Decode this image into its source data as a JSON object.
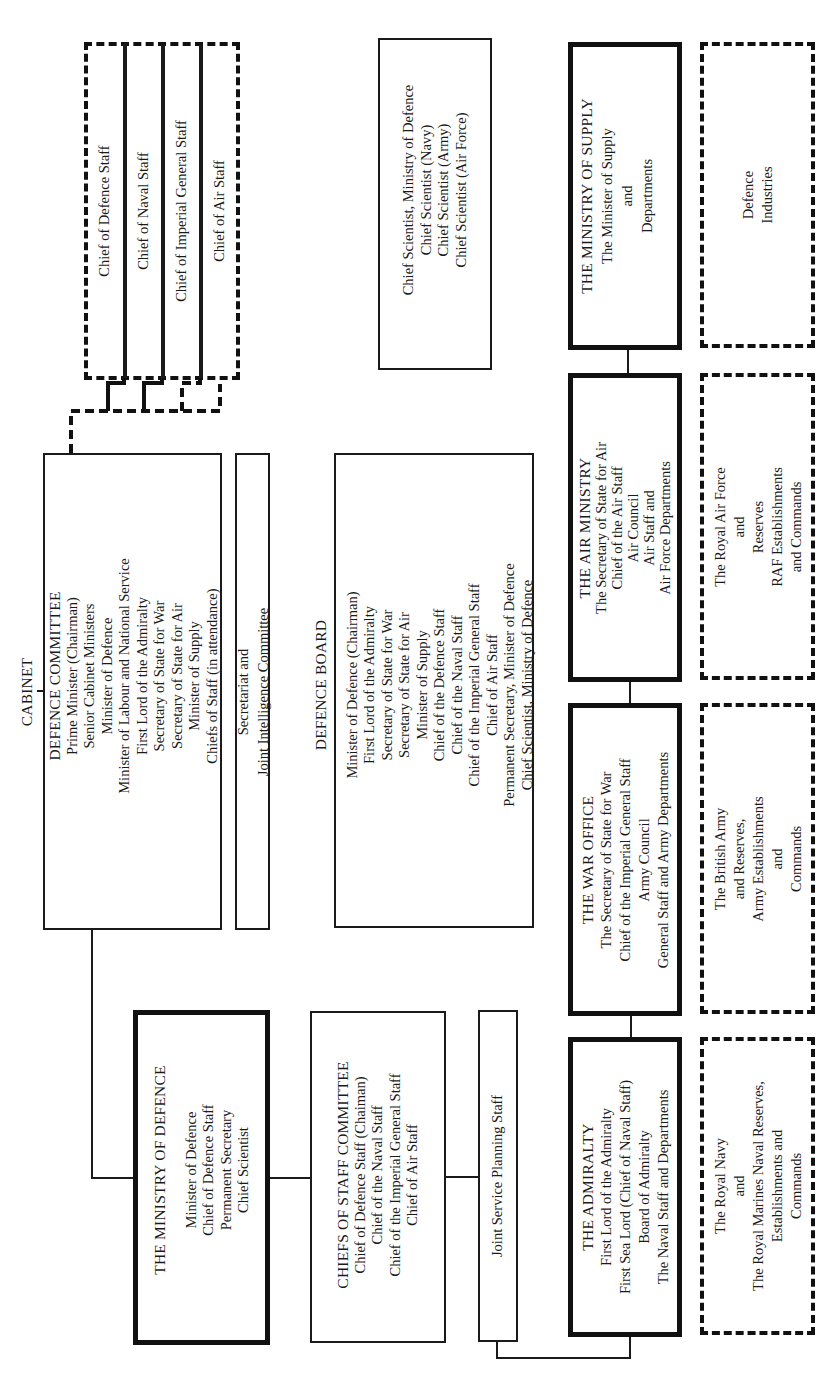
{
  "diagram": {
    "orientation": "rotated-90-ccw",
    "chiefs_group": {
      "style": "dashed",
      "items": [
        "Chief of Defence Staff",
        "Chief of Naval Staff",
        "Chief of Imperial General Staff",
        "Chief of Air Staff"
      ]
    },
    "cabinet": {
      "title": "CABINET",
      "defence_committee": {
        "title": "DEFENCE COMMITTEE",
        "members": [
          "Prime Minister (Chairman)",
          "Senior Cabinet Ministers",
          "Minister of Defence",
          "Minister of Labour and National Service",
          "First Lord of the Admiralty",
          "Secretary of State for War",
          "Secretary of State for Air",
          "Minister of Supply",
          "Chiefs of Staff (in attendance)"
        ]
      }
    },
    "secretariat": {
      "lines": [
        "Secretariat and",
        "Joint Intelligence Committee"
      ]
    },
    "chief_scientists": {
      "lines": [
        "Chief Scientist, Ministry of Defence",
        "Chief Scientist (Navy)",
        "Chief Scientist (Army)",
        "Chief Scientist (Air Force)"
      ]
    },
    "defence_board": {
      "title": "DEFENCE BOARD",
      "members": [
        "Minister of Defence (Chairman)",
        "First Lord of the Admiralty",
        "Secretary of State for War",
        "Secretary of State for Air",
        "Minister of Supply",
        "Chief of the Defence Staff",
        "Chief of the Naval Staff",
        "Chief of the Imperial General Staff",
        "Chief of Air Staff",
        "Permanent Secretary, Minister of Defence",
        "Chief Scientist, Ministry of Defence"
      ]
    },
    "ministry_of_defence": {
      "title": "THE MINISTRY OF DEFENCE",
      "members": [
        "Minister of Defence",
        "Chief of Defence Staff",
        "Permanent Secretary",
        "Chief Scientist"
      ]
    },
    "chiefs_of_staff_committee": {
      "title": "CHIEFS OF STAFF COMMITTEE",
      "members": [
        "Chief of Defence Staff (Chaiman)",
        "Chief of the Naval Staff",
        "Chief of the Imperial General Staff",
        "Chief of Air Staff"
      ]
    },
    "joint_service_planning": {
      "label": "Joint Service Planning Staff"
    },
    "ministry_of_supply": {
      "title": "THE MINISTRY OF SUPPLY",
      "lines": [
        "The Minister of Supply",
        "and",
        "Departments"
      ]
    },
    "air_ministry": {
      "title": "THE AIR MINISTRY",
      "lines": [
        "The Secretary of State for Air",
        "Chief of the Air Staff",
        "Air Council",
        "Air Staff and",
        "Air Force Departments"
      ]
    },
    "war_office": {
      "title": "THE WAR OFFICE",
      "lines": [
        "The Secretary of State for War",
        "Chief of the Imperial General Staff",
        "Army Council",
        "General Staff and Army Departments"
      ]
    },
    "admiralty": {
      "title": "THE ADMIRALTY",
      "lines": [
        "First Lord of the Admiralty",
        "First Sea Lord (Chief of Naval Staff)",
        "Board of Admiralty",
        "The Naval Staff and Departments"
      ]
    },
    "defence_industries": {
      "lines": [
        "Defence",
        "Industries"
      ]
    },
    "raf_forces": {
      "lines": [
        "The Royal Air Force",
        "and",
        "Reserves",
        "RAF Establishments",
        "and Commands"
      ]
    },
    "army_forces": {
      "lines": [
        "The British Army",
        "and Reserves,",
        "Army Establishments",
        "and",
        "Commands"
      ]
    },
    "navy_forces": {
      "lines": [
        "The Royal Navy",
        "and",
        "The Royal Marines Naval Reserves,",
        "Establishments and",
        "Commands"
      ]
    }
  }
}
